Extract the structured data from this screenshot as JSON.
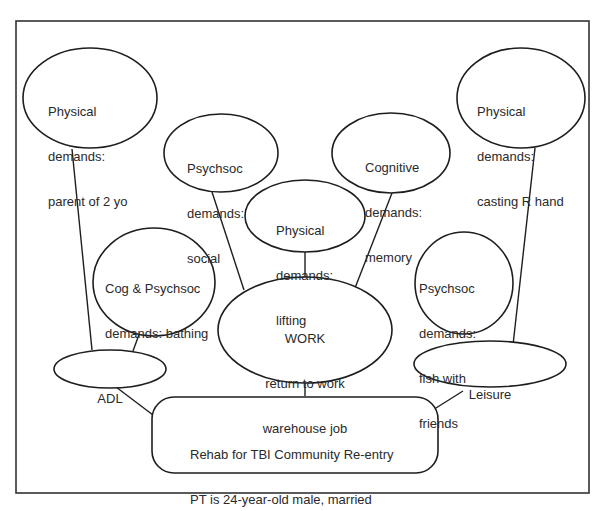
{
  "diagram": {
    "type": "concept-map",
    "central_node": {
      "line1": "Rehab for TBI Community Re-entry",
      "line2": "PT is 24-year-old male, married"
    },
    "categories": {
      "adl": "ADL",
      "work": {
        "line1": "WORK",
        "line2": "return to work",
        "line3": "warehouse job"
      },
      "leisure": "Leisure"
    },
    "demands": {
      "parent": {
        "line1": "Physical",
        "line2": "demands:",
        "line3": "parent of 2 yo"
      },
      "bathing": {
        "line1": "Cog & Psychsoc",
        "line2": "demands: bathing"
      },
      "social": {
        "line1": "Psychsoc",
        "line2": "demands:",
        "line3": "social"
      },
      "lifting": {
        "line1": "Physical",
        "line2": "demands:",
        "line3": "lifting"
      },
      "memory": {
        "line1": "Cognitive",
        "line2": "demands:",
        "line3": "memory"
      },
      "fish": {
        "line1": "Psychsoc",
        "line2": "demands:",
        "line3": "fish with",
        "line4": "friends"
      },
      "casting": {
        "line1": "Physical",
        "line2": "demands:",
        "line3": "casting R hand"
      }
    },
    "connections": [
      [
        "central_node",
        "adl"
      ],
      [
        "central_node",
        "work"
      ],
      [
        "central_node",
        "leisure"
      ],
      [
        "adl",
        "parent"
      ],
      [
        "adl",
        "bathing"
      ],
      [
        "work",
        "social"
      ],
      [
        "work",
        "lifting"
      ],
      [
        "work",
        "memory"
      ],
      [
        "leisure",
        "casting"
      ]
    ]
  }
}
